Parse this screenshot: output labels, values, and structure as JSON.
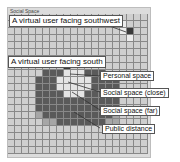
{
  "panel": {
    "title": "Social Space"
  },
  "labels": {
    "user_southwest": "A virtual user facing southwest",
    "user_south": "A virtual user facing south",
    "personal_space": "Personal space",
    "social_close": "Social space (close)",
    "social_far": "Social space (far)",
    "public_distance": "Public distance"
  },
  "grid": {
    "cols": 20,
    "rows": 20,
    "cell_px": 7,
    "legend": {
      "0": "empty",
      "1": "personal space",
      "2": "social space (close)",
      "3": "social space (far)",
      "4": "public distance",
      "5": "virtual user",
      "6": "light space (southwest user)"
    },
    "cells": [
      "00000000000000000000",
      "00000000000000006000",
      "00000000000000006500",
      "00000000000000000600",
      "00000000000000000000",
      "00000000000000000000",
      "00000000000000000000",
      "00000000500000000000",
      "00000333111333000000",
      "00003331111133330000",
      "00003331111133330000",
      "00003333111333330000",
      "00003333333333330000",
      "00003333333333330000",
      "00004333333333340000",
      "00000443333333440000",
      "00000000000000000000",
      "00000000000000000000",
      "00000000000000000000",
      "00000000000000000000"
    ]
  }
}
